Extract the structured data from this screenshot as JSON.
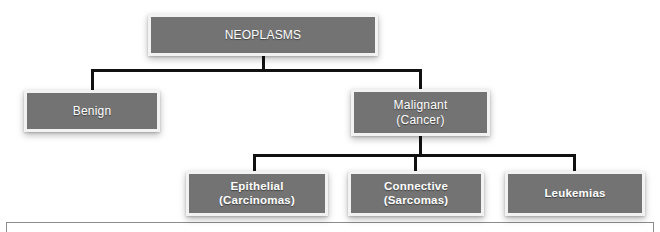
{
  "diagram": {
    "type": "hierarchy-tree",
    "title": "NEOPLASMS",
    "colors": {
      "box_fill": "#737373",
      "box_border": "#f2f2f2",
      "text": "#ffffff",
      "connector": "#111111",
      "background": "#ffffff",
      "frame_line": "#8c8c8c"
    },
    "nodes": {
      "root": {
        "label": "NEOPLASMS"
      },
      "benign": {
        "label": "Benign"
      },
      "malignant": {
        "line1": "Malignant",
        "line2": "(Cancer)"
      },
      "epithelial": {
        "line1": "Epithelial",
        "line2": "(Carcinomas)"
      },
      "connective": {
        "line1": "Connective",
        "line2": "(Sarcomas)"
      },
      "leukemias": {
        "label": "Leukemias"
      }
    },
    "edges": [
      {
        "from": "NEOPLASMS",
        "to": "Benign"
      },
      {
        "from": "NEOPLASMS",
        "to": "Malignant (Cancer)"
      },
      {
        "from": "Malignant (Cancer)",
        "to": "Epithelial (Carcinomas)"
      },
      {
        "from": "Malignant (Cancer)",
        "to": "Connective (Sarcomas)"
      },
      {
        "from": "Malignant (Cancer)",
        "to": "Leukemias"
      }
    ]
  }
}
